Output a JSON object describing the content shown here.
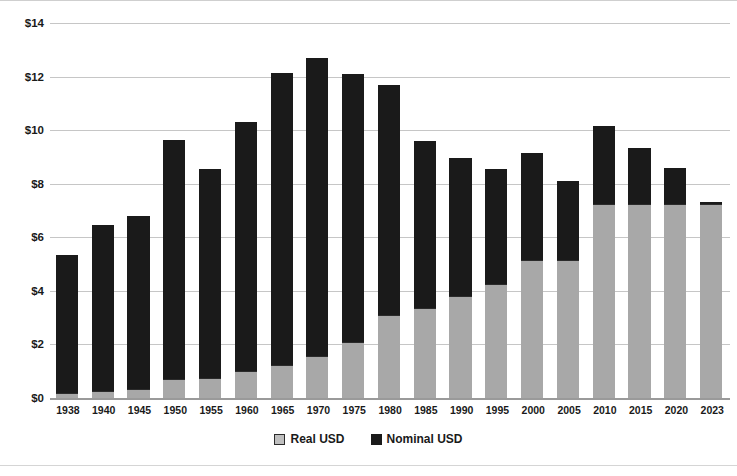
{
  "chart_data": {
    "type": "bar",
    "title": "",
    "subtitle": "",
    "xlabel": "",
    "ylabel": "",
    "grid": true,
    "legend_position": "bottom",
    "ylim": [
      0,
      14
    ],
    "ytick_step": 2,
    "ytick_labels": [
      "$0",
      "$2",
      "$4",
      "$6",
      "$8",
      "$10",
      "$12",
      "$14"
    ],
    "ytick_values": [
      0,
      2,
      4,
      6,
      8,
      10,
      12,
      14
    ],
    "categories": [
      "1938",
      "1940",
      "1945",
      "1950",
      "1955",
      "1960",
      "1965",
      "1970",
      "1975",
      "1980",
      "1985",
      "1990",
      "1995",
      "2000",
      "2005",
      "2010",
      "2015",
      "2020",
      "2023"
    ],
    "series": [
      {
        "name": "Real USD",
        "color": "#a8a8a8",
        "values": [
          0.18,
          0.25,
          0.33,
          0.72,
          0.74,
          1.0,
          1.25,
          1.55,
          2.1,
          3.1,
          3.35,
          3.8,
          4.25,
          5.15,
          5.15,
          7.25,
          7.25,
          7.25,
          7.25
        ]
      },
      {
        "name": "Nominal USD",
        "color": "#1a1a1a",
        "values": [
          5.35,
          6.45,
          6.8,
          9.65,
          8.55,
          10.3,
          12.15,
          12.7,
          12.1,
          11.7,
          9.6,
          8.95,
          8.55,
          9.15,
          8.1,
          10.15,
          9.35,
          8.6,
          7.3
        ]
      }
    ]
  },
  "legend": {
    "items": [
      {
        "label": "Real USD",
        "swatch": "real"
      },
      {
        "label": "Nominal USD",
        "swatch": "nominal"
      }
    ]
  }
}
